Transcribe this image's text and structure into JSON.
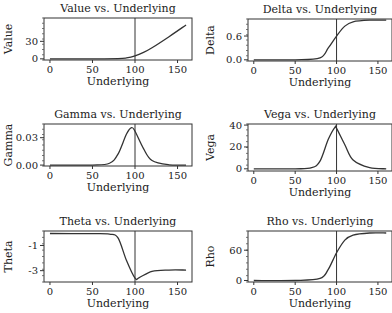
{
  "chart_data": [
    {
      "type": "line",
      "title": "Value vs. Underlying",
      "xlabel": "Underlying",
      "ylabel": "Value",
      "xticks": [
        0,
        50,
        100,
        150
      ],
      "yticks": [
        0,
        30
      ],
      "ytick_labels": [
        "0",
        "30"
      ],
      "xlim": [
        -7,
        167
      ],
      "ylim": [
        -2,
        70
      ],
      "vline": 100,
      "x": [
        0,
        50,
        80,
        90,
        100,
        110,
        120,
        140,
        160
      ],
      "y": [
        0,
        0,
        0.3,
        1.5,
        5,
        11,
        19,
        38,
        58
      ]
    },
    {
      "type": "line",
      "title": "Delta vs. Underlying",
      "xlabel": "Underlying",
      "ylabel": "Delta",
      "xticks": [
        0,
        50,
        100,
        150
      ],
      "yticks": [
        0.0,
        0.6
      ],
      "ytick_labels": [
        "0.0",
        "0.6"
      ],
      "xlim": [
        -7,
        167
      ],
      "ylim": [
        -0.03,
        1.03
      ],
      "vline": 100,
      "x": [
        0,
        50,
        80,
        90,
        100,
        110,
        120,
        140,
        160
      ],
      "y": [
        0,
        0,
        0.05,
        0.3,
        0.6,
        0.85,
        0.96,
        1.0,
        1.0
      ]
    },
    {
      "type": "line",
      "title": "Gamma vs. Underlying",
      "xlabel": "Underlying",
      "ylabel": "Gamma",
      "xticks": [
        0,
        50,
        100,
        150
      ],
      "yticks": [
        0.0,
        0.03
      ],
      "ytick_labels": [
        "0.00",
        "0.03"
      ],
      "xlim": [
        -7,
        167
      ],
      "ylim": [
        -0.001,
        0.045
      ],
      "vline": 100,
      "x": [
        0,
        50,
        70,
        80,
        90,
        96,
        100,
        110,
        120,
        140,
        160
      ],
      "y": [
        0,
        0,
        0.002,
        0.012,
        0.034,
        0.041,
        0.037,
        0.018,
        0.005,
        0.0003,
        0
      ]
    },
    {
      "type": "line",
      "title": "Vega vs. Underlying",
      "xlabel": "Underlying",
      "ylabel": "Vega",
      "xticks": [
        0,
        50,
        100,
        150
      ],
      "yticks": [
        0,
        20,
        40
      ],
      "ytick_labels": [
        "0",
        "20",
        "40"
      ],
      "xlim": [
        -7,
        167
      ],
      "ylim": [
        -2,
        41
      ],
      "vline": 100,
      "x": [
        0,
        50,
        70,
        80,
        90,
        98,
        100,
        110,
        120,
        140,
        160
      ],
      "y": [
        0,
        0,
        1,
        7,
        27,
        38,
        37,
        22,
        8,
        1,
        0
      ]
    },
    {
      "type": "line",
      "title": "Theta vs. Underlying",
      "xlabel": "Underlying",
      "ylabel": "Theta",
      "xticks": [
        0,
        50,
        100,
        150
      ],
      "yticks": [
        -1,
        -3
      ],
      "ytick_labels": [
        "-1",
        "-3"
      ],
      "xlim": [
        -7,
        167
      ],
      "ylim": [
        -3.9,
        0.15
      ],
      "vline": 100,
      "x": [
        0,
        50,
        70,
        80,
        90,
        100,
        105,
        120,
        140,
        160
      ],
      "y": [
        -0.05,
        -0.06,
        -0.1,
        -0.4,
        -2.2,
        -3.6,
        -3.55,
        -3.05,
        -2.95,
        -2.95
      ]
    },
    {
      "type": "line",
      "title": "Rho vs. Underlying",
      "xlabel": "Underlying",
      "ylabel": "Rho",
      "xticks": [
        0,
        50,
        100,
        150
      ],
      "yticks": [
        0,
        60
      ],
      "ytick_labels": [
        "0",
        "60"
      ],
      "xlim": [
        -7,
        167
      ],
      "ylim": [
        -3,
        98
      ],
      "vline": 100,
      "x": [
        0,
        50,
        80,
        90,
        100,
        110,
        120,
        140,
        160
      ],
      "y": [
        0,
        0,
        4,
        22,
        55,
        80,
        90,
        94,
        94
      ]
    }
  ],
  "panels": [
    {
      "box": [
        44,
        18,
        192,
        60
      ]
    },
    {
      "box": [
        248,
        19,
        392,
        61
      ]
    },
    {
      "box": [
        44,
        124,
        192,
        166
      ]
    },
    {
      "box": [
        248,
        124,
        392,
        171
      ]
    },
    {
      "box": [
        44,
        231,
        192,
        282
      ]
    },
    {
      "box": [
        248,
        231,
        392,
        282
      ]
    }
  ]
}
